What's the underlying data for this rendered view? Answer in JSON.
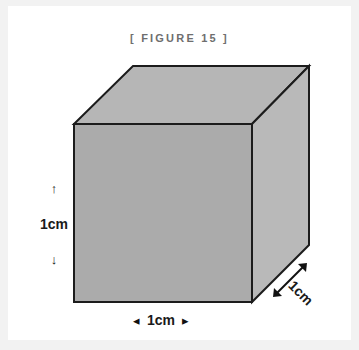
{
  "figure": {
    "title": "[ FIGURE 15 ]",
    "shape": "cube",
    "fill_front": "#ababab",
    "fill_top": "#b6b6b6",
    "fill_right": "#b9b9b9",
    "stroke": "#1c1c1c",
    "background": "#ffffff",
    "page_background": "#f2f2f2",
    "title_color": "#6e6e6e"
  },
  "dimensions": {
    "height": {
      "value": "1cm",
      "up_arrow": "↑",
      "down_arrow": "↓"
    },
    "width": {
      "value": "1cm",
      "left_arrow": "◂",
      "right_arrow": "▸"
    },
    "depth": {
      "value": "1cm"
    }
  }
}
